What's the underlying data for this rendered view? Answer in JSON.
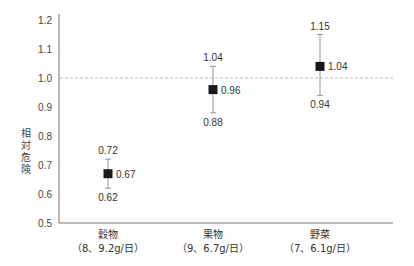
{
  "chart_data": {
    "type": "scatter",
    "title": "",
    "xlabel": "",
    "ylabel": "相対危険",
    "ylim": [
      0.5,
      1.2
    ],
    "yticks": [
      "0.5",
      "0.6",
      "0.7",
      "0.8",
      "0.9",
      "1.0",
      "1.1",
      "1.2"
    ],
    "reference_line": {
      "y": 1.0,
      "style": "dashed"
    },
    "grid": false,
    "categories": [
      "穀物",
      "果物",
      "野菜"
    ],
    "category_sublabels": [
      "（8、9.2g/日）",
      "（9、6.7g/日）",
      "（7、6.1g/日）"
    ],
    "series": [
      {
        "name": "相対危険 (95%信頼区間)",
        "values": [
          0.67,
          0.96,
          1.04
        ],
        "lower": [
          0.62,
          0.88,
          0.94
        ],
        "upper": [
          0.72,
          1.04,
          1.15
        ],
        "labels": [
          "0.67",
          "0.96",
          "1.04"
        ],
        "lower_labels": [
          "0.62",
          "0.88",
          "0.94"
        ],
        "upper_labels": [
          "0.72",
          "1.04",
          "1.15"
        ]
      }
    ]
  }
}
